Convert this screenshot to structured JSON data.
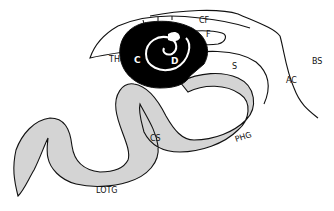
{
  "figure": {
    "type": "anatomical schematic",
    "colors": {
      "gray_band": "#d4d4d4",
      "dark_region": "#000000",
      "outline": "#111111",
      "background": "#ffffff"
    }
  },
  "labels": {
    "cf": "CF",
    "f": "F",
    "th": "TH",
    "c": "C",
    "d": "D",
    "s": "S",
    "ac": "AC",
    "bs": "BS",
    "cs": "CS",
    "phg": "PHG",
    "lotg": "LOTG"
  }
}
